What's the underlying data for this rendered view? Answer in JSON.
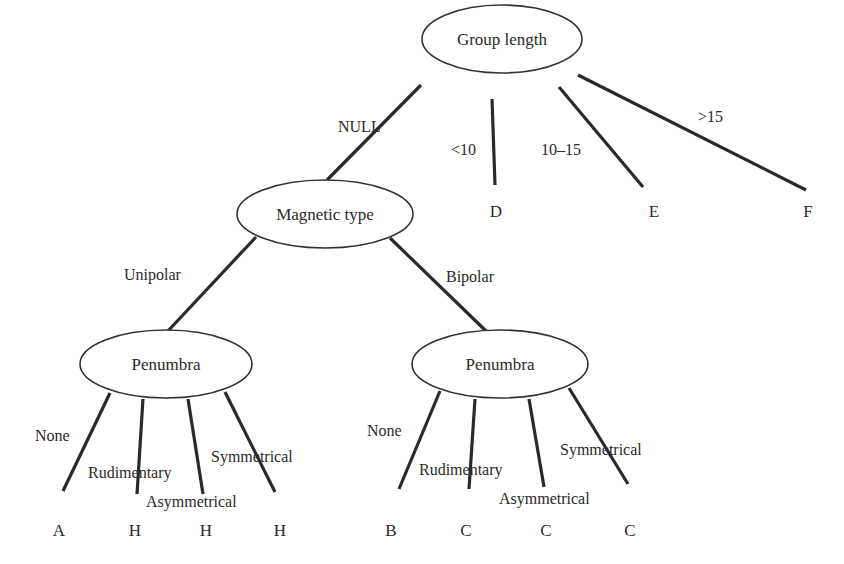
{
  "diagram": {
    "type": "decision-tree",
    "colors": {
      "line": "#2a2a2a",
      "ellipse_stroke": "#333333",
      "background": "#ffffff",
      "text": "#2a2a2a"
    },
    "nodes": [
      {
        "id": "group_length",
        "label": "Group length",
        "cx": 502,
        "cy": 39,
        "rx": 80,
        "ry": 34
      },
      {
        "id": "magnetic_type",
        "label": "Magnetic type",
        "cx": 325,
        "cy": 214,
        "rx": 88,
        "ry": 34
      },
      {
        "id": "penumbra_left",
        "label": "Penumbra",
        "cx": 166,
        "cy": 364,
        "rx": 86,
        "ry": 34
      },
      {
        "id": "penumbra_right",
        "label": "Penumbra",
        "cx": 500,
        "cy": 364,
        "rx": 88,
        "ry": 34
      }
    ],
    "edges": [
      {
        "from": "group_length",
        "to": "magnetic_type",
        "label": "NULL",
        "x1": 421,
        "y1": 85,
        "x2": 327,
        "y2": 180,
        "lx": 338,
        "ly": 132
      },
      {
        "from": "group_length",
        "to": "D",
        "label": "<10",
        "x1": 492,
        "y1": 99,
        "x2": 495,
        "y2": 185,
        "lx": 451,
        "ly": 155
      },
      {
        "from": "group_length",
        "to": "E",
        "label": "10–15",
        "x1": 559,
        "y1": 87,
        "x2": 643,
        "y2": 187,
        "lx": 541,
        "ly": 155
      },
      {
        "from": "group_length",
        "to": "F",
        "label": ">15",
        "x1": 578,
        "y1": 75,
        "x2": 806,
        "y2": 190,
        "lx": 698,
        "ly": 122
      },
      {
        "from": "magnetic_type",
        "to": "penumbra_left",
        "label": "Unipolar",
        "x1": 256,
        "y1": 237,
        "x2": 167,
        "y2": 332,
        "lx": 124,
        "ly": 280
      },
      {
        "from": "magnetic_type",
        "to": "penumbra_right",
        "label": "Bipolar",
        "x1": 390,
        "y1": 238,
        "x2": 486,
        "y2": 331,
        "lx": 446,
        "ly": 282
      },
      {
        "from": "penumbra_left",
        "to": "A",
        "label": "None",
        "x1": 110,
        "y1": 393,
        "x2": 63,
        "y2": 491,
        "lx": 35,
        "ly": 441
      },
      {
        "from": "penumbra_left",
        "to": "H1",
        "label": "Rudimentary",
        "x1": 143,
        "y1": 399,
        "x2": 137,
        "y2": 494,
        "lx": 88,
        "ly": 478
      },
      {
        "from": "penumbra_left",
        "to": "H2",
        "label": "Asymmetrical",
        "x1": 188,
        "y1": 399,
        "x2": 203,
        "y2": 494,
        "lx": 146,
        "ly": 507
      },
      {
        "from": "penumbra_left",
        "to": "H3",
        "label": "Symmetrical",
        "x1": 225,
        "y1": 392,
        "x2": 275,
        "y2": 492,
        "lx": 211,
        "ly": 462
      },
      {
        "from": "penumbra_right",
        "to": "B",
        "label": "None",
        "x1": 440,
        "y1": 391,
        "x2": 399,
        "y2": 489,
        "lx": 367,
        "ly": 436
      },
      {
        "from": "penumbra_right",
        "to": "C1",
        "label": "Rudimentary",
        "x1": 475,
        "y1": 399,
        "x2": 469,
        "y2": 489,
        "lx": 419,
        "ly": 475
      },
      {
        "from": "penumbra_right",
        "to": "C2",
        "label": "Asymmetrical",
        "x1": 529,
        "y1": 399,
        "x2": 544,
        "y2": 487,
        "lx": 499,
        "ly": 504
      },
      {
        "from": "penumbra_right",
        "to": "C3",
        "label": "Symmetrical",
        "x1": 569,
        "y1": 388,
        "x2": 628,
        "y2": 484,
        "lx": 560,
        "ly": 455
      }
    ],
    "leaves": [
      {
        "id": "D",
        "label": "D",
        "x": 496,
        "y": 217
      },
      {
        "id": "E",
        "label": "E",
        "x": 654,
        "y": 217
      },
      {
        "id": "F",
        "label": "F",
        "x": 808,
        "y": 217
      },
      {
        "id": "A",
        "label": "A",
        "x": 59,
        "y": 536
      },
      {
        "id": "H1",
        "label": "H",
        "x": 135,
        "y": 536
      },
      {
        "id": "H2",
        "label": "H",
        "x": 206,
        "y": 536
      },
      {
        "id": "H3",
        "label": "H",
        "x": 280,
        "y": 536
      },
      {
        "id": "B",
        "label": "B",
        "x": 391,
        "y": 536
      },
      {
        "id": "C1",
        "label": "C",
        "x": 466,
        "y": 536
      },
      {
        "id": "C2",
        "label": "C",
        "x": 546,
        "y": 536
      },
      {
        "id": "C3",
        "label": "C",
        "x": 630,
        "y": 536
      }
    ]
  }
}
